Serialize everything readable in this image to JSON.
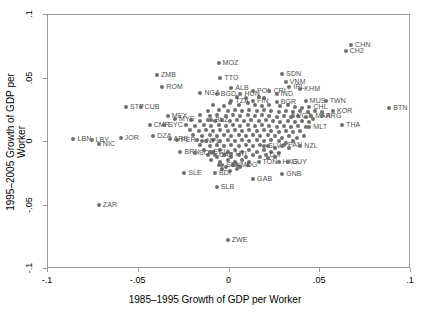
{
  "chart_data": {
    "type": "scatter",
    "title": "",
    "xlabel": "1985–1995 Growth of GDP per Worker",
    "ylabel": "1995–2005 Growth of GDP per Worker",
    "xlim": [
      -0.1,
      0.1
    ],
    "ylim": [
      -0.1,
      0.1
    ],
    "xticks": [
      -0.1,
      -0.05,
      0,
      0.05,
      0.1
    ],
    "xtick_labels": [
      "-.1",
      "-.05",
      "0",
      ".05",
      ".1"
    ],
    "yticks": [
      -0.1,
      -0.05,
      0,
      0.05,
      0.1
    ],
    "ytick_labels": [
      "-.1",
      "-.05",
      "0",
      ".05",
      ".1"
    ],
    "grid": false,
    "legend": null,
    "marker_color": "#6f6f6f",
    "label_color": "#4f4f4f",
    "frame_color": "#9a9a9a",
    "points": [
      {
        "label": "CHN",
        "x": 0.067,
        "y": 0.0765
      },
      {
        "label": "CH2",
        "x": 0.064,
        "y": 0.0715
      },
      {
        "label": "MOZ",
        "x": -0.006,
        "y": 0.0625
      },
      {
        "label": "SDN",
        "x": 0.029,
        "y": 0.0535
      },
      {
        "label": "ZMB",
        "x": -0.04,
        "y": 0.0525
      },
      {
        "label": "TTO",
        "x": -0.005,
        "y": 0.0505
      },
      {
        "label": "VNM",
        "x": 0.031,
        "y": 0.0475
      },
      {
        "label": "ROM",
        "x": -0.037,
        "y": 0.0435
      },
      {
        "label": "ALB",
        "x": 0.001,
        "y": 0.0425
      },
      {
        "label": "IRL",
        "x": 0.033,
        "y": 0.0435
      },
      {
        "label": "KHM",
        "x": 0.039,
        "y": 0.0415
      },
      {
        "label": "POL",
        "x": 0.013,
        "y": 0.0405
      },
      {
        "label": "CRI",
        "x": 0.022,
        "y": 0.0405
      },
      {
        "label": "NGA",
        "x": -0.016,
        "y": 0.0385
      },
      {
        "label": "BGD",
        "x": -0.007,
        "y": 0.0375
      },
      {
        "label": "HUN",
        "x": 0.006,
        "y": 0.0375
      },
      {
        "label": "IND",
        "x": 0.026,
        "y": 0.0375
      },
      {
        "label": "MUS",
        "x": 0.042,
        "y": 0.0325
      },
      {
        "label": "TWN",
        "x": 0.053,
        "y": 0.0325
      },
      {
        "label": "TZA",
        "x": 0.001,
        "y": 0.0325
      },
      {
        "label": "FIN",
        "x": 0.013,
        "y": 0.0325
      },
      {
        "label": "BGR",
        "x": 0.026,
        "y": 0.0315
      },
      {
        "label": "STP",
        "x": -0.057,
        "y": 0.0275
      },
      {
        "label": "CUB",
        "x": -0.049,
        "y": 0.0275
      },
      {
        "label": "BTN",
        "x": 0.088,
        "y": 0.0265
      },
      {
        "label": "CHL",
        "x": 0.044,
        "y": 0.0275
      },
      {
        "label": "KOR",
        "x": 0.057,
        "y": 0.0245
      },
      {
        "label": "MEX",
        "x": -0.034,
        "y": 0.0205
      },
      {
        "label": "VCT",
        "x": 0.035,
        "y": 0.0205
      },
      {
        "label": "MAR",
        "x": 0.045,
        "y": 0.0205
      },
      {
        "label": "ARG",
        "x": 0.051,
        "y": 0.0205
      },
      {
        "label": "MYS",
        "x": -0.03,
        "y": 0.0185
      },
      {
        "label": "BLZ",
        "x": -0.01,
        "y": 0.0175
      },
      {
        "label": "CMR",
        "x": -0.044,
        "y": 0.0135
      },
      {
        "label": "SYC",
        "x": -0.036,
        "y": 0.0135
      },
      {
        "label": "THA",
        "x": 0.062,
        "y": 0.0135
      },
      {
        "label": "MLT",
        "x": 0.044,
        "y": 0.0115
      },
      {
        "label": "DZA",
        "x": -0.042,
        "y": 0.0045
      },
      {
        "label": "JOR",
        "x": -0.06,
        "y": 0.0035
      },
      {
        "label": "LBN",
        "x": -0.086,
        "y": 0.0025
      },
      {
        "label": "LBY",
        "x": -0.076,
        "y": 0.0015
      },
      {
        "label": "PER",
        "x": -0.029,
        "y": 0.0015
      },
      {
        "label": "ARE",
        "x": -0.033,
        "y": 0.0025
      },
      {
        "label": "NPL",
        "x": -0.015,
        "y": 0.0005
      },
      {
        "label": "NIC",
        "x": -0.072,
        "y": -0.0015
      },
      {
        "label": "SLV",
        "x": 0.019,
        "y": -0.0035
      },
      {
        "label": "PAN",
        "x": 0.03,
        "y": -0.0025
      },
      {
        "label": "NZL",
        "x": 0.039,
        "y": -0.0035
      },
      {
        "label": "BRN",
        "x": -0.027,
        "y": -0.0075
      },
      {
        "label": "SOM",
        "x": -0.019,
        "y": -0.0085
      },
      {
        "label": "ECU",
        "x": -0.011,
        "y": -0.0075
      },
      {
        "label": "CAF",
        "x": -0.008,
        "y": -0.0105
      },
      {
        "label": "HTI",
        "x": 0.001,
        "y": -0.0095
      },
      {
        "label": "DJI",
        "x": 0.02,
        "y": -0.0105
      },
      {
        "label": "TON",
        "x": 0.016,
        "y": -0.0155
      },
      {
        "label": "HKG",
        "x": 0.027,
        "y": -0.0155
      },
      {
        "label": "GUY",
        "x": 0.032,
        "y": -0.0155
      },
      {
        "label": "SEN",
        "x": -0.004,
        "y": -0.0185
      },
      {
        "label": "MDG",
        "x": 0.004,
        "y": -0.0185
      },
      {
        "label": "SLE",
        "x": -0.025,
        "y": -0.0245
      },
      {
        "label": "BDI",
        "x": -0.008,
        "y": -0.0245
      },
      {
        "label": "GNB",
        "x": 0.029,
        "y": -0.0255
      },
      {
        "label": "GAB",
        "x": 0.013,
        "y": -0.0295
      },
      {
        "label": "SLB",
        "x": -0.007,
        "y": -0.0355
      },
      {
        "label": "ZAR",
        "x": -0.072,
        "y": -0.0495
      },
      {
        "label": "ZWE",
        "x": -0.001,
        "y": -0.0775
      }
    ],
    "unlabeled_points": [
      [
        0.004,
        0.0355
      ],
      [
        0.009,
        0.0345
      ],
      [
        0.016,
        0.0355
      ],
      [
        0.019,
        0.0345
      ],
      [
        0.0,
        0.0305
      ],
      [
        0.005,
        0.0295
      ],
      [
        0.01,
        0.0305
      ],
      [
        0.014,
        0.0295
      ],
      [
        0.018,
        0.0285
      ],
      [
        0.022,
        0.0295
      ],
      [
        0.028,
        0.0285
      ],
      [
        0.032,
        0.0295
      ],
      [
        -0.003,
        0.0285
      ],
      [
        -0.009,
        0.0295
      ],
      [
        0.036,
        0.0275
      ],
      [
        0.04,
        0.0265
      ],
      [
        -0.012,
        0.0245
      ],
      [
        -0.006,
        0.0255
      ],
      [
        -0.001,
        0.0245
      ],
      [
        0.003,
        0.0255
      ],
      [
        0.007,
        0.0245
      ],
      [
        0.011,
        0.0255
      ],
      [
        0.015,
        0.0245
      ],
      [
        0.019,
        0.0255
      ],
      [
        0.023,
        0.0245
      ],
      [
        0.027,
        0.0235
      ],
      [
        0.031,
        0.0245
      ],
      [
        0.035,
        0.0235
      ],
      [
        0.039,
        0.0245
      ],
      [
        0.043,
        0.0235
      ],
      [
        0.047,
        0.0245
      ],
      [
        0.051,
        0.0235
      ],
      [
        -0.016,
        0.0215
      ],
      [
        -0.011,
        0.0205
      ],
      [
        -0.007,
        0.0215
      ],
      [
        -0.002,
        0.0205
      ],
      [
        0.002,
        0.0215
      ],
      [
        0.006,
        0.0205
      ],
      [
        0.01,
        0.0215
      ],
      [
        0.014,
        0.0205
      ],
      [
        0.018,
        0.0215
      ],
      [
        0.022,
        0.0205
      ],
      [
        0.026,
        0.0195
      ],
      [
        0.03,
        0.0205
      ],
      [
        0.034,
        0.0195
      ],
      [
        0.038,
        0.0205
      ],
      [
        0.042,
        0.0195
      ],
      [
        0.046,
        0.0185
      ],
      [
        -0.021,
        0.0175
      ],
      [
        -0.016,
        0.0165
      ],
      [
        -0.012,
        0.0175
      ],
      [
        -0.008,
        0.0165
      ],
      [
        -0.004,
        0.0175
      ],
      [
        0.0,
        0.0165
      ],
      [
        0.004,
        0.0175
      ],
      [
        0.008,
        0.0165
      ],
      [
        0.012,
        0.0175
      ],
      [
        0.016,
        0.0165
      ],
      [
        0.02,
        0.0175
      ],
      [
        0.024,
        0.0165
      ],
      [
        0.028,
        0.0155
      ],
      [
        0.032,
        0.0165
      ],
      [
        0.036,
        0.0155
      ],
      [
        0.04,
        0.0165
      ],
      [
        0.044,
        0.0155
      ],
      [
        -0.024,
        0.0135
      ],
      [
        -0.019,
        0.0125
      ],
      [
        -0.014,
        0.0135
      ],
      [
        -0.01,
        0.0125
      ],
      [
        -0.006,
        0.0135
      ],
      [
        -0.002,
        0.0125
      ],
      [
        0.002,
        0.0135
      ],
      [
        0.006,
        0.0125
      ],
      [
        0.01,
        0.0135
      ],
      [
        0.014,
        0.0125
      ],
      [
        0.018,
        0.0135
      ],
      [
        0.022,
        0.0125
      ],
      [
        0.026,
        0.0115
      ],
      [
        0.03,
        0.0125
      ],
      [
        0.034,
        0.0115
      ],
      [
        0.038,
        0.0125
      ],
      [
        0.042,
        0.0115
      ],
      [
        -0.022,
        0.0095
      ],
      [
        -0.017,
        0.0085
      ],
      [
        -0.013,
        0.0095
      ],
      [
        -0.009,
        0.0085
      ],
      [
        -0.005,
        0.0095
      ],
      [
        -0.001,
        0.0085
      ],
      [
        0.003,
        0.0095
      ],
      [
        0.007,
        0.0085
      ],
      [
        0.011,
        0.0095
      ],
      [
        0.015,
        0.0085
      ],
      [
        0.019,
        0.0095
      ],
      [
        0.023,
        0.0085
      ],
      [
        0.027,
        0.0075
      ],
      [
        0.031,
        0.0085
      ],
      [
        0.035,
        0.0075
      ],
      [
        0.039,
        0.0085
      ],
      [
        -0.02,
        0.0055
      ],
      [
        -0.015,
        0.0045
      ],
      [
        -0.011,
        0.0055
      ],
      [
        -0.007,
        0.0045
      ],
      [
        -0.003,
        0.0055
      ],
      [
        0.001,
        0.0045
      ],
      [
        0.005,
        0.0055
      ],
      [
        0.009,
        0.0045
      ],
      [
        0.013,
        0.0055
      ],
      [
        0.017,
        0.0045
      ],
      [
        0.021,
        0.0055
      ],
      [
        0.025,
        0.0045
      ],
      [
        0.029,
        0.0035
      ],
      [
        0.033,
        0.0045
      ],
      [
        0.037,
        0.0035
      ],
      [
        0.041,
        0.0045
      ],
      [
        -0.018,
        0.0015
      ],
      [
        -0.013,
        0.0005
      ],
      [
        -0.009,
        0.0015
      ],
      [
        -0.005,
        0.0005
      ],
      [
        -0.001,
        0.0015
      ],
      [
        0.003,
        0.0005
      ],
      [
        0.007,
        0.0015
      ],
      [
        0.011,
        0.0005
      ],
      [
        0.015,
        0.0015
      ],
      [
        0.019,
        0.0005
      ],
      [
        0.023,
        0.0015
      ],
      [
        0.027,
        0.0005
      ],
      [
        0.031,
        -0.0005
      ],
      [
        0.035,
        0.0005
      ],
      [
        -0.016,
        -0.0025
      ],
      [
        -0.011,
        -0.0035
      ],
      [
        -0.007,
        -0.0025
      ],
      [
        -0.003,
        -0.0035
      ],
      [
        0.001,
        -0.0025
      ],
      [
        0.005,
        -0.0035
      ],
      [
        0.009,
        -0.0025
      ],
      [
        0.013,
        -0.0035
      ],
      [
        0.017,
        -0.0025
      ],
      [
        0.021,
        -0.0035
      ],
      [
        0.025,
        -0.0045
      ],
      [
        0.029,
        -0.0035
      ],
      [
        0.033,
        -0.0045
      ],
      [
        -0.014,
        -0.0065
      ],
      [
        -0.009,
        -0.0075
      ],
      [
        -0.005,
        -0.0065
      ],
      [
        -0.001,
        -0.0075
      ],
      [
        0.003,
        -0.0065
      ],
      [
        0.007,
        -0.0075
      ],
      [
        0.011,
        -0.0065
      ],
      [
        0.015,
        -0.0075
      ],
      [
        0.019,
        -0.0065
      ],
      [
        0.023,
        -0.0075
      ],
      [
        0.027,
        -0.0085
      ],
      [
        -0.012,
        -0.0105
      ],
      [
        -0.007,
        -0.0115
      ],
      [
        -0.003,
        -0.0105
      ],
      [
        0.001,
        -0.0115
      ],
      [
        0.005,
        -0.0105
      ],
      [
        0.009,
        -0.0115
      ],
      [
        0.013,
        -0.0105
      ],
      [
        0.017,
        -0.0115
      ],
      [
        0.021,
        -0.0125
      ],
      [
        0.025,
        -0.0115
      ],
      [
        -0.01,
        -0.0145
      ],
      [
        -0.005,
        -0.0155
      ],
      [
        -0.001,
        -0.0145
      ],
      [
        0.003,
        -0.0155
      ],
      [
        0.007,
        -0.0145
      ],
      [
        0.011,
        -0.0155
      ],
      [
        -0.006,
        -0.0185
      ],
      [
        -0.002,
        -0.0195
      ],
      [
        0.002,
        -0.0185
      ],
      [
        0.006,
        -0.0195
      ],
      [
        0.01,
        -0.0185
      ],
      [
        -0.004,
        -0.0215
      ],
      [
        0.0,
        -0.0225
      ],
      [
        0.004,
        -0.0215
      ]
    ]
  }
}
